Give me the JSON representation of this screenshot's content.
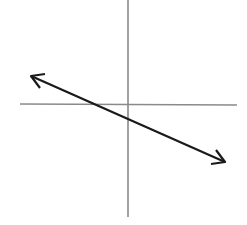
{
  "diagram": {
    "type": "coordinate-plane-line",
    "axis_color": "#8a8a8a",
    "line_color": "#1a1a1a",
    "slope_sign": "negative",
    "x_intercept": "negative",
    "y_intercept": "negative"
  }
}
